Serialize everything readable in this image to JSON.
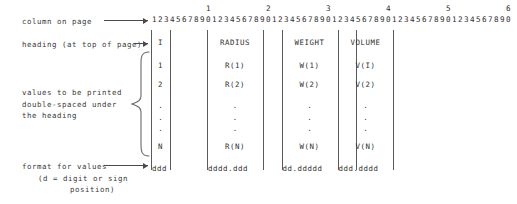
{
  "diagram": {
    "ruler": {
      "tens_markers": [
        "1",
        "2",
        "3",
        "4",
        "5",
        "6"
      ],
      "ones_digits": "123456789012345678901234567890123456789012345678901234567890",
      "columns_total": 60
    },
    "labels": {
      "column_on_page": "column on page",
      "heading_at_top": "heading (at top of page)",
      "values_note_line1": "values to be printed",
      "values_note_line2": "double-spaced under",
      "values_note_line3": "the heading",
      "format_line1": "format for values",
      "format_line2": "(d = digit or sign",
      "format_line3": "position)"
    },
    "table": {
      "headings": [
        "I",
        "RADIUS",
        "WEIGHT",
        "VOLUME"
      ],
      "rows": [
        [
          "1",
          "R(1)",
          "W(1)",
          "V(I)"
        ],
        [
          "2",
          "R(2)",
          "W(2)",
          "V(2)"
        ],
        [
          ".",
          ".",
          ".",
          "."
        ],
        [
          ".",
          ".",
          ".",
          "."
        ],
        [
          ".",
          ".",
          ".",
          "."
        ],
        [
          "N",
          "R(N)",
          "W(N)",
          "V(N)"
        ]
      ],
      "ellipsis": ".\n.\n.",
      "formats": [
        "ddd",
        "dddd.ddd",
        "dd.ddddd",
        "ddd.dddd"
      ]
    },
    "colors": {
      "ink": "#2f2f2f",
      "rule": "#5a5a5a",
      "background": "#ffffff"
    }
  }
}
